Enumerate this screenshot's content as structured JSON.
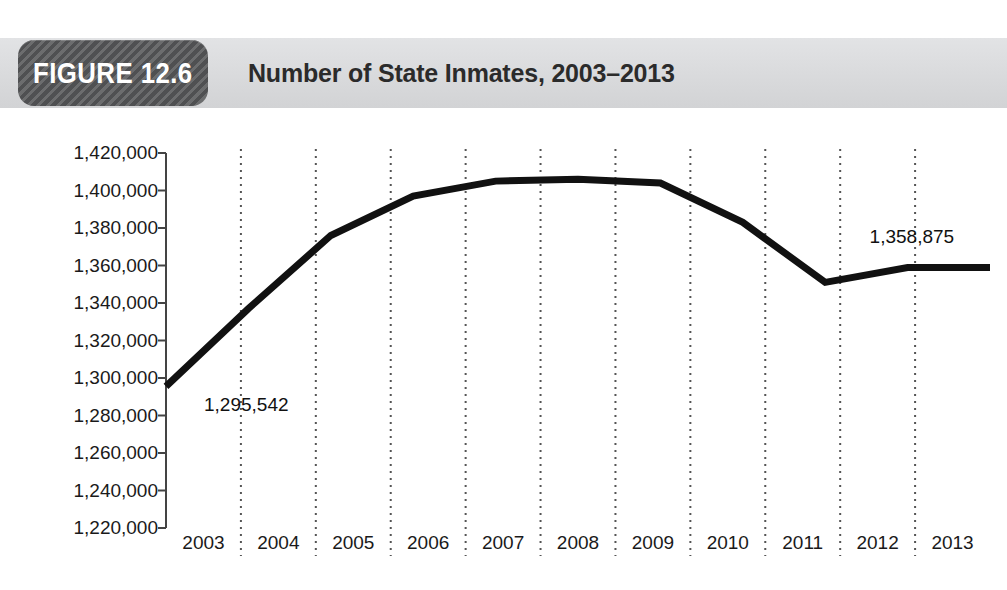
{
  "figure": {
    "badge_label": "FIGURE 12.6",
    "title": "Number of State Inmates, 2003–2013"
  },
  "colors": {
    "header_bar": "#d9dadc",
    "badge": "#5b5c5e",
    "line": "#111111",
    "gridline": "#555555",
    "axis": "#444444",
    "text": "#1a1a1a"
  },
  "chart_data": {
    "type": "line",
    "title": "Number of State Inmates, 2003–2013",
    "xlabel": "",
    "ylabel": "",
    "categories": [
      "2003",
      "2004",
      "2005",
      "2006",
      "2007",
      "2008",
      "2009",
      "2010",
      "2011",
      "2012",
      "2013"
    ],
    "values": [
      1295542,
      1337000,
      1376000,
      1397000,
      1405000,
      1406000,
      1404000,
      1383000,
      1351000,
      1358875,
      1358875
    ],
    "ylim": [
      1220000,
      1420000
    ],
    "ytick_step": 20000,
    "ytick_labels": [
      "1,420,000",
      "1,400,000",
      "1,380,000",
      "1,360,000",
      "1,340,000",
      "1,320,000",
      "1,300,000",
      "1,280,000",
      "1,260,000",
      "1,240,000",
      "1,220,000"
    ],
    "ytick_values": [
      1420000,
      1400000,
      1380000,
      1360000,
      1340000,
      1320000,
      1300000,
      1280000,
      1260000,
      1240000,
      1220000
    ],
    "grid": "vertical-dotted-between-categories",
    "legend": "none",
    "annotations": [
      {
        "label": "1,295,542",
        "category": "2003",
        "value": 1295542
      },
      {
        "label": "1,358,875",
        "category": "2012",
        "value": 1358875
      }
    ]
  }
}
